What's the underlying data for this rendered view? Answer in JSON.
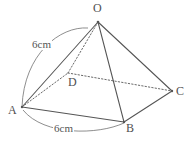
{
  "figure": {
    "kind": "square-pyramid",
    "background_color": "#ffffff",
    "line_color": "#555555",
    "label_color": "#4f4f4f",
    "dim_color": "#555555",
    "width": 196,
    "height": 149
  },
  "vertices": [
    {
      "id": "O",
      "label": "O",
      "x": 98,
      "y": 22,
      "hidden": false
    },
    {
      "id": "A",
      "label": "A",
      "x": 22,
      "y": 107,
      "hidden": false
    },
    {
      "id": "B",
      "label": "B",
      "x": 124,
      "y": 122,
      "hidden": false
    },
    {
      "id": "C",
      "label": "C",
      "x": 172,
      "y": 91,
      "hidden": false
    },
    {
      "id": "D",
      "label": "D",
      "x": 68,
      "y": 73,
      "hidden": true
    }
  ],
  "edges": [
    {
      "from": "O",
      "to": "A",
      "style": "solid"
    },
    {
      "from": "O",
      "to": "B",
      "style": "solid"
    },
    {
      "from": "O",
      "to": "C",
      "style": "solid"
    },
    {
      "from": "A",
      "to": "B",
      "style": "solid"
    },
    {
      "from": "B",
      "to": "C",
      "style": "solid"
    },
    {
      "from": "O",
      "to": "D",
      "style": "dotted"
    },
    {
      "from": "A",
      "to": "D",
      "style": "dotted"
    },
    {
      "from": "D",
      "to": "C",
      "style": "dotted"
    }
  ],
  "dimensions": [
    {
      "id": "oa",
      "value": "6cm",
      "measures": "O-A",
      "arc_side": "left"
    },
    {
      "id": "ab",
      "value": "6cm",
      "measures": "A-B",
      "arc_side": "below"
    }
  ]
}
